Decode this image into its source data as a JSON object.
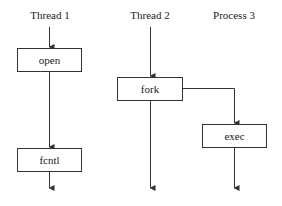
{
  "columns": [
    {
      "id": "thread1",
      "title": "Thread 1"
    },
    {
      "id": "thread2",
      "title": "Thread 2"
    },
    {
      "id": "process3",
      "title": "Process 3"
    }
  ],
  "nodes": [
    {
      "id": "open",
      "label": "open",
      "column": "thread1"
    },
    {
      "id": "fcntl",
      "label": "fcntl",
      "column": "thread1"
    },
    {
      "id": "fork",
      "label": "fork",
      "column": "thread2"
    },
    {
      "id": "exec",
      "label": "exec",
      "column": "process3"
    }
  ],
  "edges": [
    {
      "from": "thread1-start",
      "to": "open"
    },
    {
      "from": "open",
      "to": "fcntl"
    },
    {
      "from": "fcntl",
      "to": "thread1-end"
    },
    {
      "from": "thread2-start",
      "to": "fork"
    },
    {
      "from": "fork",
      "to": "thread2-end"
    },
    {
      "from": "fork",
      "to": "exec"
    },
    {
      "from": "exec",
      "to": "process3-end"
    }
  ],
  "colors": {
    "line": "#333333",
    "background": "#ffffff"
  }
}
